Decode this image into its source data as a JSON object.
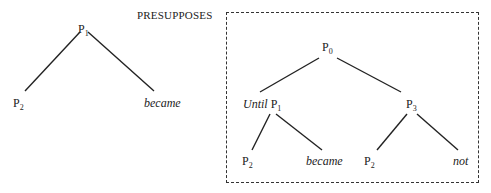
{
  "figure": {
    "label": "PRESUPPOSES",
    "left_tree": {
      "root": {
        "base": "P",
        "sub": "1"
      },
      "left_child": {
        "base": "P",
        "sub": "2"
      },
      "right_child": "became"
    },
    "right_tree": {
      "root": {
        "base": "P",
        "sub": "0"
      },
      "left": {
        "word": "Until",
        "base": "P",
        "sub": "1",
        "children": [
          {
            "base": "P",
            "sub": "2"
          },
          "became"
        ]
      },
      "right": {
        "base": "P",
        "sub": "3",
        "children": [
          {
            "base": "P",
            "sub": "2"
          },
          "not"
        ]
      }
    }
  }
}
